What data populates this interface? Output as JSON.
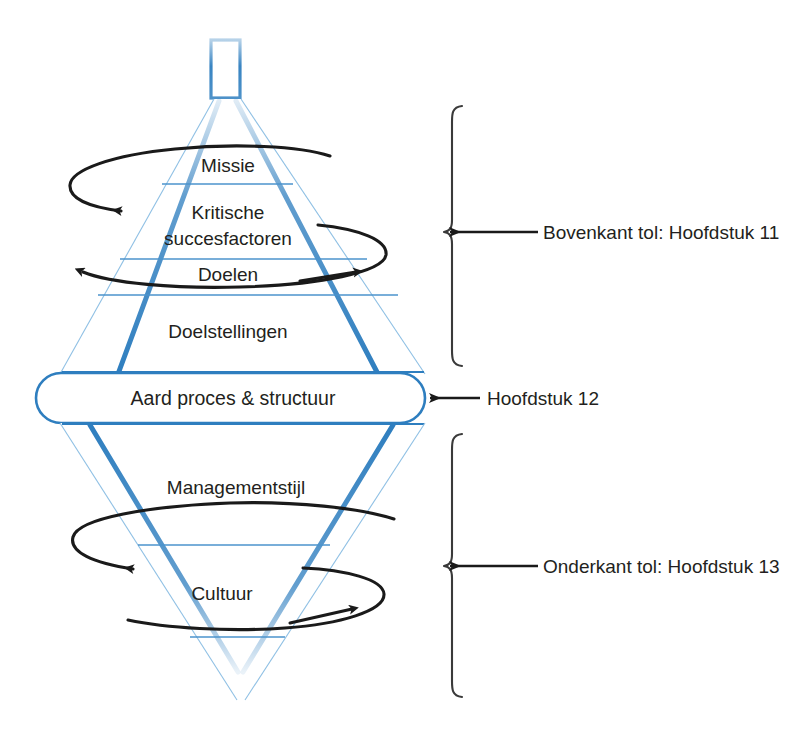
{
  "diagram": {
    "colors": {
      "cone_edge_blue": "#2e7ebf",
      "divider_blue": "#4b93cd",
      "swirl_black": "#1a1a1a",
      "bracket_gray": "#3a3a3a",
      "text": "#231f20",
      "background": "#ffffff"
    },
    "top_spike": {
      "name": "tol-tip"
    },
    "upper_cone": {
      "tiers": [
        {
          "id": "missie",
          "label": "Missie"
        },
        {
          "id": "kritische-succesfactoren",
          "label": "Kritische",
          "label_line2": "succesfactoren"
        },
        {
          "id": "doelen",
          "label": "Doelen"
        },
        {
          "id": "doelstellingen",
          "label": "Doelstellingen"
        }
      ]
    },
    "middle_band": {
      "label": "Aard proces & structuur"
    },
    "lower_cone": {
      "tiers": [
        {
          "id": "managementstijl",
          "label": "Managementstijl"
        },
        {
          "id": "cultuur",
          "label": "Cultuur"
        }
      ]
    },
    "swirls": [
      {
        "id": "swirl-missie",
        "direction": "left"
      },
      {
        "id": "swirl-doelen",
        "direction": "right"
      },
      {
        "id": "swirl-managementstijl",
        "direction": "left"
      },
      {
        "id": "swirl-cultuur",
        "direction": "right"
      }
    ],
    "annotations": [
      {
        "id": "bovenkant-tol",
        "label": "Bovenkant tol: Hoofdstuk 11",
        "bracket": true
      },
      {
        "id": "hoofdstuk-12",
        "label": "Hoofdstuk 12",
        "bracket": false
      },
      {
        "id": "onderkant-tol",
        "label": "Onderkant tol: Hoofdstuk 13",
        "bracket": true
      }
    ]
  }
}
